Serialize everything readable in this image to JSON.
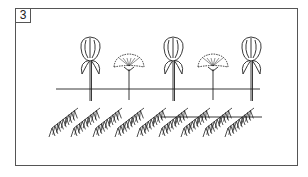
{
  "step": {
    "number": "3"
  },
  "illustration": {
    "description": "Alternating tulip-like buds and flat-topped flower heads on stems above a horizontal line, with a row of pine/conifer sprigs laid along a second line below",
    "top_row": [
      "bud",
      "cluster",
      "bud",
      "cluster",
      "bud"
    ],
    "greenery_count": 9,
    "line_color": "#333333"
  }
}
